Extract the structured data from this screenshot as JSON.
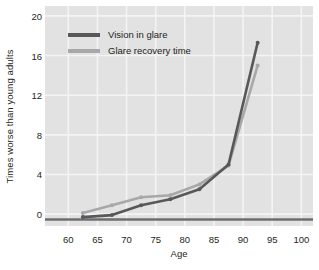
{
  "chart_data": {
    "type": "line",
    "title": "",
    "xlabel": "Age",
    "ylabel": "Times worse than young adults",
    "xlim": [
      56,
      102
    ],
    "ylim": [
      -1.2,
      21
    ],
    "xticks": [
      60,
      65,
      70,
      75,
      80,
      85,
      90,
      95,
      100
    ],
    "yticks": [
      0,
      4,
      8,
      12,
      16,
      20
    ],
    "grid": true,
    "legend_position": "top-left",
    "x": [
      62.5,
      67.5,
      72.5,
      77.5,
      82.5,
      87.5,
      92.5
    ],
    "series": [
      {
        "name": "Vision in glare",
        "color": "#58585a",
        "values": [
          -0.3,
          -0.1,
          0.9,
          1.5,
          2.5,
          5.0,
          17.3
        ]
      },
      {
        "name": "Glare recovery time",
        "color": "#a8a8aa",
        "values": [
          0.1,
          0.9,
          1.7,
          1.9,
          3.0,
          4.9,
          15.0
        ]
      }
    ]
  },
  "axes": {
    "y_title": "Times worse than young adults",
    "x_title": "Age",
    "y_tick_labels": [
      "0",
      "4",
      "8",
      "12",
      "16",
      "20"
    ],
    "x_tick_labels": [
      "60",
      "65",
      "70",
      "75",
      "80",
      "85",
      "90",
      "95",
      "100"
    ]
  },
  "legend": {
    "items": [
      {
        "label": "Vision in glare",
        "color": "#58585a"
      },
      {
        "label": "Glare recovery time",
        "color": "#a8a8aa"
      }
    ]
  },
  "colors": {
    "plot_background": "#e2e2e2",
    "grid": "#f4f4f4",
    "series_dark": "#58585a",
    "series_light": "#a8a8aa",
    "text": "#231f20",
    "page_background": "#ffffff"
  }
}
